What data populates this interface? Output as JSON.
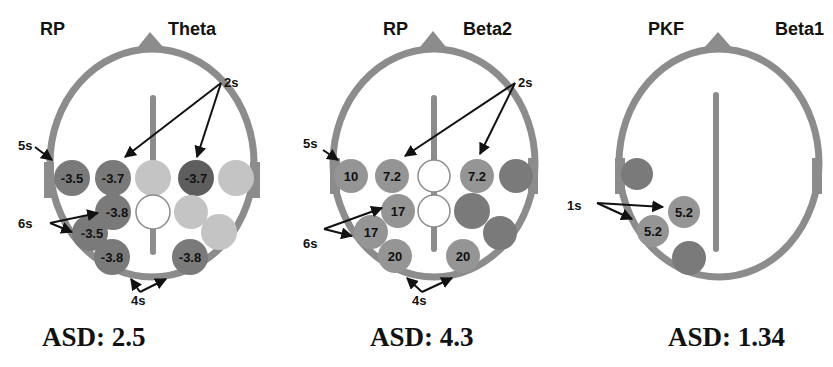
{
  "panels": [
    {
      "id": "theta",
      "title_left": "RP",
      "title_right": "Theta",
      "asd_label": "ASD: 2.5",
      "annotations": {
        "top": "2s",
        "left_upper": "5s",
        "left_middle": "6s",
        "bottom": "4s"
      },
      "electrodes": [
        {
          "pos": "row1-1",
          "value": "-3.5",
          "shade": "dark"
        },
        {
          "pos": "row1-2",
          "value": "-3.7",
          "shade": "dark"
        },
        {
          "pos": "row1-3",
          "value": "",
          "shade": "light"
        },
        {
          "pos": "row1-4",
          "value": "-3.7",
          "shade": "darkest"
        },
        {
          "pos": "row1-5",
          "value": "",
          "shade": "light"
        },
        {
          "pos": "row2-1",
          "value": "-3.8",
          "shade": "dark"
        },
        {
          "pos": "row2-2",
          "value": "",
          "shade": "white"
        },
        {
          "pos": "row2-3",
          "value": "",
          "shade": "light"
        },
        {
          "pos": "row3-1",
          "value": "-3.5",
          "shade": "dark"
        },
        {
          "pos": "row3-2",
          "value": "",
          "shade": "light"
        },
        {
          "pos": "row4-1",
          "value": "-3.8",
          "shade": "dark"
        },
        {
          "pos": "row4-2",
          "value": "-3.8",
          "shade": "dark"
        }
      ]
    },
    {
      "id": "beta2",
      "title_left": "RP",
      "title_right": "Beta2",
      "asd_label": "ASD: 4.3",
      "annotations": {
        "top": "2s",
        "left_upper": "5s",
        "left_middle": "6s",
        "bottom": "4s"
      },
      "electrodes": [
        {
          "pos": "row1-1",
          "value": "10",
          "shade": "medium"
        },
        {
          "pos": "row1-2",
          "value": "7.2",
          "shade": "medium"
        },
        {
          "pos": "row1-3",
          "value": "",
          "shade": "white"
        },
        {
          "pos": "row1-4",
          "value": "7.2",
          "shade": "medium"
        },
        {
          "pos": "row1-5",
          "value": "",
          "shade": "dark"
        },
        {
          "pos": "row2-1",
          "value": "17",
          "shade": "medium"
        },
        {
          "pos": "row2-2",
          "value": "",
          "shade": "white"
        },
        {
          "pos": "row2-3",
          "value": "",
          "shade": "dark"
        },
        {
          "pos": "row3-1",
          "value": "17",
          "shade": "medium"
        },
        {
          "pos": "row3-2",
          "value": "",
          "shade": "dark"
        },
        {
          "pos": "row4-1",
          "value": "20",
          "shade": "medium"
        },
        {
          "pos": "row4-2",
          "value": "20",
          "shade": "medium"
        }
      ]
    },
    {
      "id": "beta1",
      "title_left": "PKF",
      "title_right": "Beta1",
      "asd_label": "ASD: 1.34",
      "annotations": {
        "left_middle": "1s"
      },
      "electrodes": [
        {
          "pos": "left-1",
          "value": "",
          "shade": "dark"
        },
        {
          "pos": "left-2",
          "value": "5.2",
          "shade": "medium"
        },
        {
          "pos": "left-3",
          "value": "5.2",
          "shade": "medium"
        },
        {
          "pos": "left-4",
          "value": "",
          "shade": "dark"
        }
      ]
    }
  ],
  "colors": {
    "outline": "#8c8c8c",
    "darkest": "#5e5e5e",
    "dark": "#7a7a7a",
    "medium": "#959595",
    "light": "#c4c4c4",
    "white": "#ffffff",
    "arrow": "#111111"
  }
}
